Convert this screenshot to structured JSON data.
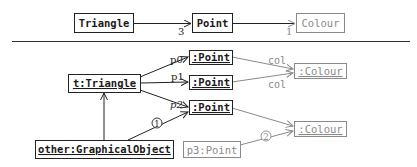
{
  "class_diagram": {
    "classes": [
      {
        "id": "triangle",
        "label": "Triangle",
        "style": "dark"
      },
      {
        "id": "point",
        "label": "Point",
        "style": "dark"
      },
      {
        "id": "colour",
        "label": "Colour",
        "style": "grey"
      }
    ],
    "associations": [
      {
        "from": "triangle",
        "to": "point",
        "multiplicity": "3"
      },
      {
        "from": "point",
        "to": "colour",
        "multiplicity": "1"
      }
    ]
  },
  "object_diagram": {
    "objects": [
      {
        "id": "t",
        "label": "t:Triangle",
        "style": "dark",
        "underlined": true
      },
      {
        "id": "pt0",
        "label": ":Point",
        "style": "dark",
        "underlined": true
      },
      {
        "id": "pt1",
        "label": ":Point",
        "style": "dark",
        "underlined": true
      },
      {
        "id": "pt2",
        "label": ":Point",
        "style": "dark",
        "underlined": true
      },
      {
        "id": "c1",
        "label": ":Colour",
        "style": "grey",
        "underlined": true
      },
      {
        "id": "c2",
        "label": ":Colour",
        "style": "grey",
        "underlined": true
      },
      {
        "id": "other",
        "label": "other:GraphicalObject",
        "style": "dark",
        "underlined": true
      },
      {
        "id": "p3",
        "label": "p3:Point",
        "style": "grey",
        "underlined": false
      }
    ],
    "links": [
      {
        "from": "t",
        "to": "pt0",
        "label": "p0"
      },
      {
        "from": "t",
        "to": "pt1",
        "label": "p1"
      },
      {
        "from": "t",
        "to": "pt2",
        "label": "p2"
      },
      {
        "from": "pt0",
        "to": "c1",
        "label": "col"
      },
      {
        "from": "pt1",
        "to": "c1",
        "label": "col"
      },
      {
        "from": "pt2",
        "to": "c2",
        "label": ""
      },
      {
        "from": "other",
        "to": "t",
        "label": ""
      },
      {
        "from": "other",
        "to": "pt2",
        "label": "1"
      },
      {
        "from": "p3",
        "to": "c2",
        "label": "2"
      }
    ]
  }
}
